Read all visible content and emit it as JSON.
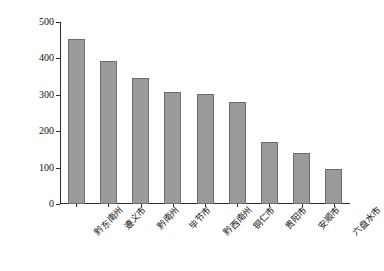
{
  "chart_data": {
    "type": "bar",
    "title": "",
    "xlabel": "",
    "ylabel": "地表水资源现状面积/km²",
    "ylabel_main": "地表水资源现状面积/km",
    "ylabel_sup": "2",
    "categories": [
      "黔东南州",
      "遵义市",
      "黔南州",
      "毕节市",
      "黔西南州",
      "铜仁市",
      "贵阳市",
      "安顺市",
      "六盘水市"
    ],
    "values": [
      452,
      393,
      347,
      307,
      301,
      280,
      171,
      139,
      95
    ],
    "ylim": [
      0,
      500
    ],
    "yticks": [
      0,
      100,
      200,
      300,
      400,
      500
    ],
    "ytick_labels": [
      "0",
      "100",
      "200",
      "300",
      "400",
      "500"
    ],
    "grid": false,
    "legend": null,
    "bar_fill_color": "#9a9a9a",
    "bar_edge_color": "#6d6d6d",
    "axis_color": "#2b2b2b",
    "background_color": "#ffffff"
  }
}
